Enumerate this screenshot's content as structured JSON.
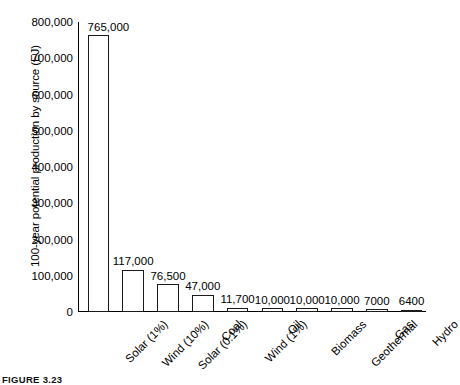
{
  "chart_data": {
    "type": "bar",
    "title": "",
    "xlabel": "",
    "ylabel": "100-year potential production by source (EJ)",
    "ylim": [
      0,
      800000
    ],
    "grid": false,
    "legend": null,
    "categories": [
      "Solar (1%)",
      "Wind (10%)",
      "Solar (0.1%)",
      "Coal",
      "Wind (1%)",
      "Oil",
      "Biomass",
      "Geothermal",
      "Gas",
      "Hydro"
    ],
    "values": [
      765000,
      117000,
      76500,
      47000,
      11700,
      10000,
      10000,
      10000,
      7000,
      6400
    ],
    "value_labels": [
      "765,000",
      "117,000",
      "76,500",
      "47,000",
      "11,700",
      "10,000",
      "10,000",
      "10,000",
      "7000",
      "6400"
    ],
    "ytick_values": [
      0,
      100000,
      200000,
      300000,
      400000,
      500000,
      600000,
      700000,
      800000
    ],
    "ytick_labels": [
      "0",
      "100,000",
      "200,000",
      "300,000",
      "400,000",
      "500,000",
      "600,000",
      "700,000",
      "800,000"
    ]
  },
  "figure": {
    "caption": "FIGURE 3.23"
  },
  "colors": {
    "bar_outline": "#1a1a1a",
    "bar_fill": "#ffffff",
    "axis": "#000000",
    "text": "#000000",
    "background": "#ffffff"
  }
}
